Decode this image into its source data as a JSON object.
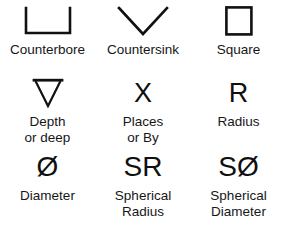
{
  "page": {
    "background_color": "#ffffff",
    "ink_color": "#141414"
  },
  "symbols": [
    {
      "id": "counterbore",
      "glyph_type": "shape",
      "glyph_name": "counterbore-symbol",
      "caption_lines": [
        "Counterbore"
      ]
    },
    {
      "id": "countersink",
      "glyph_type": "shape",
      "glyph_name": "countersink-symbol",
      "caption_lines": [
        "Countersink"
      ]
    },
    {
      "id": "square",
      "glyph_type": "shape",
      "glyph_name": "square-symbol",
      "caption_lines": [
        "Square"
      ]
    },
    {
      "id": "depth",
      "glyph_type": "shape",
      "glyph_name": "depth-symbol",
      "caption_lines": [
        "Depth",
        "or deep"
      ]
    },
    {
      "id": "places",
      "glyph_type": "text",
      "glyph_name": "places-symbol",
      "glyph_text": "X",
      "caption_lines": [
        "Places",
        "or By"
      ]
    },
    {
      "id": "radius",
      "glyph_type": "text",
      "glyph_name": "radius-symbol",
      "glyph_text": "R",
      "caption_lines": [
        "Radius"
      ]
    },
    {
      "id": "diameter",
      "glyph_type": "text",
      "glyph_name": "diameter-symbol",
      "glyph_text": "Ø",
      "caption_lines": [
        "Diameter"
      ]
    },
    {
      "id": "spherical-radius",
      "glyph_type": "text",
      "glyph_name": "spherical-radius-symbol",
      "glyph_text": "SR",
      "caption_lines": [
        "Spherical",
        "Radius"
      ]
    },
    {
      "id": "spherical-diameter",
      "glyph_type": "text",
      "glyph_name": "spherical-diameter-symbol",
      "glyph_text": "SØ",
      "caption_lines": [
        "Spherical",
        "Diameter"
      ]
    }
  ]
}
